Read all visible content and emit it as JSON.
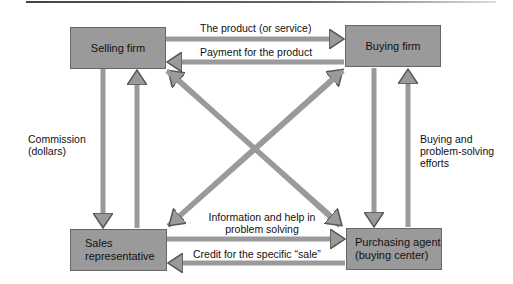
{
  "nodes": {
    "selling_firm": "Selling firm",
    "buying_firm": "Buying firm",
    "sales_rep_line1": "Sales",
    "sales_rep_line2": "representative",
    "purchasing_line1": "Purchasing agent",
    "purchasing_line2": "(buying center)"
  },
  "edges": {
    "product": "The product (or service)",
    "payment": "Payment for the product",
    "commission_line1": "Commission",
    "commission_line2": "(dollars)",
    "buying_line1": "Buying and",
    "buying_line2": "problem-solving",
    "buying_line3": "efforts",
    "info_line1": "Information and help in",
    "info_line2": "problem solving",
    "credit": "Credit for the specific “sale”"
  },
  "colors": {
    "box": "#9a9a9a",
    "arrow": "#9a9a9a",
    "outline": "#555555"
  }
}
